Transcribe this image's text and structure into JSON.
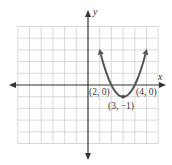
{
  "chart_data": {
    "type": "line",
    "title": "",
    "xlabel": "x",
    "ylabel": "y",
    "xlim": [
      -6,
      6
    ],
    "ylim": [
      -5,
      5
    ],
    "grid": true,
    "series": [
      {
        "name": "parabola y = (x-2)(x-4)",
        "function": "y = x^2 - 6x + 8",
        "x": [
          1.0,
          1.5,
          2,
          2.5,
          3,
          3.5,
          4,
          4.5,
          5.0
        ],
        "y": [
          3.0,
          1.25,
          0,
          -0.75,
          -1,
          -0.75,
          0,
          1.25,
          3.0
        ]
      }
    ],
    "annotations": [
      {
        "text": "(2, 0)",
        "x": 2,
        "y": 0
      },
      {
        "text": "(3, −1)",
        "x": 3,
        "y": -1
      },
      {
        "text": "(4, 0)",
        "x": 4,
        "y": 0
      }
    ]
  },
  "labels": {
    "x_axis": "x",
    "y_axis": "y",
    "point_left": "(2, 0)",
    "point_vertex": "(3, −1)",
    "point_right": "(4, 0)"
  },
  "colors": {
    "curve": "#555555",
    "axis": "#333333",
    "grid": "#cfcfcf"
  }
}
